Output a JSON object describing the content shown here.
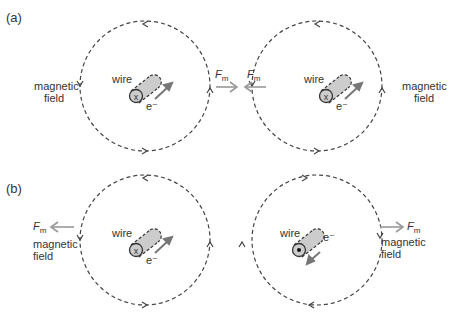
{
  "panels": [
    {
      "label": "(a)",
      "left": {
        "wire_label": "wire",
        "electron_label": "e⁻",
        "wire_symbol": "x",
        "field_label_1": "magnetic",
        "field_label_2": "field"
      },
      "right": {
        "wire_label": "wire",
        "electron_label": "e⁻",
        "wire_symbol": "x",
        "field_label_1": "magnetic",
        "field_label_2": "field"
      },
      "force_left": "F",
      "force_right": "F",
      "force_sub": "m"
    },
    {
      "label": "(b)",
      "left": {
        "wire_label": "wire",
        "electron_label": "e⁻",
        "wire_symbol": "x",
        "field_label_1": "magnetic",
        "field_label_2": "field"
      },
      "right": {
        "wire_label": "wire",
        "electron_label": "e⁻",
        "wire_symbol": "dot",
        "field_label_1": "magnetic",
        "field_label_2": "field"
      },
      "force_left": "F",
      "force_right": "F",
      "force_sub": "m"
    }
  ],
  "colors": {
    "dash": "#444444",
    "force_arrow": "#999999",
    "wire_fill": "#cccccc",
    "electron_arrow": "#777777"
  }
}
